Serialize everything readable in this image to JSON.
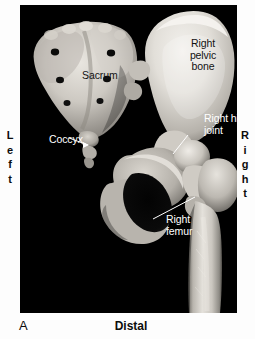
{
  "figure": {
    "panel_letter": "A",
    "plate_background": "#000000",
    "page_background": "#ffffff"
  },
  "orientation": {
    "left": {
      "label": "Left",
      "letters": [
        "L",
        "e",
        "f",
        "t"
      ]
    },
    "right": {
      "label": "Right",
      "letters": [
        "R",
        "i",
        "g",
        "h",
        "t"
      ]
    },
    "bottom": {
      "label": "Distal"
    }
  },
  "annotations": {
    "right_pelvic_bone": {
      "text": "Right\npelvic\nbone",
      "color": "#121212",
      "has_leader": false
    },
    "sacrum": {
      "text": "Sacrum",
      "color": "#121212",
      "has_leader": false
    },
    "coccyx": {
      "text": "Coccyx",
      "color": "#ffffff",
      "has_leader": true
    },
    "right_hip_joint": {
      "text": "Right hip\njoint",
      "color": "#ffffff",
      "has_leader": true
    },
    "right_femur": {
      "text": "Right\nfemur",
      "color": "#ffffff",
      "has_leader": true
    }
  },
  "structures": [
    {
      "name": "sacrum"
    },
    {
      "name": "coccyx"
    },
    {
      "name": "right-pelvic-bone"
    },
    {
      "name": "obturator-foramen"
    },
    {
      "name": "right-hip-joint"
    },
    {
      "name": "right-femur"
    }
  ]
}
